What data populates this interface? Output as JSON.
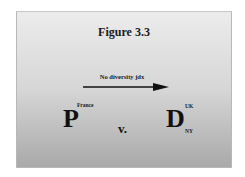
{
  "slide": {
    "title": "Figure 3.3",
    "arrow_label": "No diversity jdx",
    "plaintiff": {
      "letter": "P",
      "superscript": "France"
    },
    "versus": "v.",
    "defendant": {
      "letter": "D",
      "superscript": "UK",
      "subscript": "NY"
    }
  },
  "colors": {
    "gradient_top": "#ececec",
    "gradient_bottom": "#a9a9a9",
    "text": "#111111"
  }
}
